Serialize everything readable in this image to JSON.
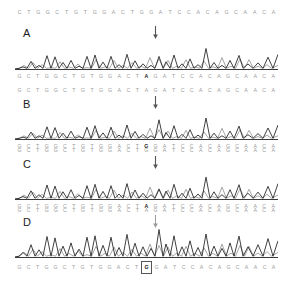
{
  "figure": {
    "background_color": "#ffffff",
    "trace_color_dark": "#2b2b2b",
    "trace_color_light": "#8e8e8e",
    "sequence_text_color": "#9a9a9a",
    "highlight_text_color": "#1a1a1a",
    "label_color": "#1c1c1c",
    "arrow_color": "#555555"
  },
  "panels": [
    {
      "label": "A",
      "top_sequence": "CTGGCTGTGGACTGGATCCACAGCAACA",
      "bottom_sequence": "GCTGGCTGTGGACTAGATCCACAGCAACA",
      "bottom_highlight_index": 14,
      "bottom_highlight_style": "bold",
      "arrow": "down-arrow",
      "arrow_present": true
    },
    {
      "label": "B",
      "top_sequence": "GCTGGCTGTGGACTAGATCCACAGCAACA",
      "bottom_sequence": "GCTGGCTGTGGACTGGATCCACAGCAACA",
      "bottom_highlight_index": 14,
      "bottom_highlight_style": "bold",
      "arrow": "down-arrow",
      "arrow_present": true
    },
    {
      "label": "C",
      "top_sequence": "GCTGGCTGTGGACTGGATCCACAGCAACA",
      "bottom_sequence": "GCTGGCTGTGGACTAGATCCACAGCAACA",
      "bottom_highlight_index": 14,
      "bottom_highlight_style": "bold",
      "arrow": "down-arrow",
      "arrow_present": true
    },
    {
      "label": "D",
      "top_sequence": "GCTGGCTGTGGACTAGATCCACAGCAACA",
      "bottom_sequence": "GCTGGCTGTGGACTGGATCCACAGCAACA",
      "bottom_highlight_index": 14,
      "bottom_highlight_style": "boxed",
      "arrow": "down-arrow",
      "arrow_present": true
    }
  ],
  "chart_data": {
    "type": "line",
    "xlabel": "",
    "ylabel": "",
    "grid": false,
    "legend": "none",
    "n_positions": 29,
    "arrow_position_index": 14,
    "panels": [
      {
        "name": "A",
        "series": [
          {
            "name": "dark-trace",
            "values": [
              8,
              26,
              14,
              46,
              42,
              20,
              28,
              48,
              16,
              44,
              50,
              22,
              46,
              18,
              52,
              40,
              24,
              20,
              46,
              30,
              50,
              26,
              40,
              18,
              84,
              30,
              22,
              38,
              58
            ]
          },
          {
            "name": "light-trace",
            "values": [
              6,
              14,
              30,
              22,
              16,
              34,
              18,
              22,
              40,
              18,
              22,
              38,
              16,
              36,
              24,
              50,
              44,
              38,
              24,
              46,
              20,
              42,
              22,
              50,
              24,
              48,
              44,
              20,
              30
            ]
          }
        ]
      },
      {
        "name": "B",
        "series": [
          {
            "name": "dark-trace",
            "values": [
              8,
              24,
              16,
              44,
              40,
              22,
              30,
              46,
              18,
              42,
              48,
              24,
              44,
              20,
              76,
              38,
              26,
              22,
              44,
              32,
              48,
              28,
              38,
              20,
              86,
              28,
              24,
              36,
              54
            ]
          },
          {
            "name": "light-trace",
            "values": [
              6,
              16,
              28,
              20,
              18,
              32,
              20,
              24,
              38,
              20,
              24,
              36,
              18,
              34,
              26,
              52,
              42,
              36,
              26,
              44,
              22,
              40,
              24,
              48,
              26,
              46,
              42,
              22,
              28
            ]
          }
        ]
      },
      {
        "name": "C",
        "series": [
          {
            "name": "dark-trace",
            "values": [
              10,
              28,
              18,
              48,
              44,
              24,
              32,
              50,
              20,
              46,
              52,
              26,
              48,
              22,
              56,
              42,
              28,
              24,
              48,
              34,
              52,
              30,
              42,
              22,
              88,
              32,
              26,
              40,
              56
            ]
          },
          {
            "name": "light-trace",
            "values": [
              8,
              18,
              32,
              24,
              20,
              36,
              22,
              26,
              42,
              22,
              26,
              40,
              20,
              38,
              28,
              54,
              46,
              40,
              28,
              48,
              24,
              44,
              26,
              52,
              28,
              50,
              46,
              24,
              32
            ]
          }
        ]
      },
      {
        "name": "D",
        "series": [
          {
            "name": "dark-trace",
            "values": [
              14,
              34,
              22,
              54,
              50,
              30,
              38,
              56,
              26,
              52,
              58,
              32,
              54,
              28,
              92,
              48,
              34,
              30,
              54,
              40,
              58,
              36,
              48,
              28,
              70,
              38,
              32,
              46,
              60
            ]
          },
          {
            "name": "light-trace",
            "values": [
              10,
              22,
              38,
              30,
              24,
              42,
              28,
              32,
              48,
              28,
              32,
              46,
              26,
              44,
              34,
              60,
              52,
              46,
              34,
              54,
              30,
              50,
              32,
              58,
              34,
              56,
              52,
              30,
              38
            ]
          }
        ]
      }
    ]
  }
}
